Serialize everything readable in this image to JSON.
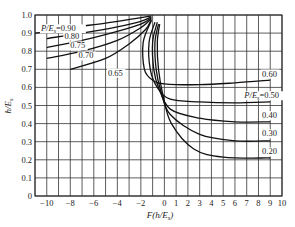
{
  "chart_data": {
    "type": "line",
    "title": "",
    "xlabel": "F(h/E_s)",
    "ylabel": "h/E_s",
    "xlim": [
      -11,
      10
    ],
    "ylim": [
      0,
      1.0
    ],
    "grid": true,
    "x_ticks": [
      -10,
      -8,
      -6,
      -4,
      -2,
      0,
      1,
      2,
      3,
      4,
      5,
      6,
      7,
      8,
      9,
      10
    ],
    "x_tick_labels": [
      "−10",
      "−8",
      "−6",
      "−4",
      "−2",
      "0",
      "1",
      "2",
      "3",
      "4",
      "5",
      "6",
      "7",
      "8",
      "9",
      "10"
    ],
    "y_ticks": [
      0,
      0.1,
      0.2,
      0.3,
      0.4,
      0.5,
      0.6,
      0.7,
      0.8,
      0.9,
      1.0
    ],
    "y_tick_labels": [
      "0",
      "0.1",
      "0.2",
      "0.3",
      "0.4",
      "0.5",
      "0.6",
      "0.7",
      "0.8",
      "0.9",
      "1.0"
    ],
    "series": [
      {
        "name": "P/E_s=0.90",
        "label": "P/E_s=0.90",
        "points": [
          [
            -11,
            0.9
          ],
          [
            -8,
            0.93
          ],
          [
            -5,
            0.955
          ],
          [
            -2.5,
            0.98
          ],
          [
            -1.1,
            0.995
          ]
        ]
      },
      {
        "name": "0.80",
        "label": "0.80",
        "points": [
          [
            -10,
            0.87
          ],
          [
            -7,
            0.9
          ],
          [
            -4,
            0.935
          ],
          [
            -2,
            0.965
          ],
          [
            -1.1,
            0.99
          ]
        ]
      },
      {
        "name": "0.75",
        "label": "0.75",
        "points": [
          [
            -10,
            0.82
          ],
          [
            -7,
            0.86
          ],
          [
            -4,
            0.91
          ],
          [
            -2,
            0.95
          ],
          [
            -1.1,
            0.985
          ]
        ]
      },
      {
        "name": "0.70",
        "label": "0.70",
        "points": [
          [
            -10,
            0.76
          ],
          [
            -7,
            0.8
          ],
          [
            -4,
            0.86
          ],
          [
            -2,
            0.93
          ],
          [
            -1.1,
            0.98
          ]
        ]
      },
      {
        "name": "0.65",
        "label": "0.65",
        "points": [
          [
            -8,
            0.7
          ],
          [
            -5,
            0.76
          ],
          [
            -3,
            0.84
          ],
          [
            -1.6,
            0.92
          ],
          [
            -1.1,
            0.975
          ]
        ]
      },
      {
        "name": "0.60",
        "label": "0.60",
        "points": [
          [
            -1.1,
            0.97
          ],
          [
            -1.8,
            0.85
          ],
          [
            -1.7,
            0.7
          ],
          [
            -1.0,
            0.64
          ],
          [
            0,
            0.62
          ],
          [
            3,
            0.615
          ],
          [
            6,
            0.625
          ],
          [
            9,
            0.64
          ]
        ]
      },
      {
        "name": "P/E_s=0.50",
        "label": "P/E_s=0.50",
        "points": [
          [
            -0.8,
            0.96
          ],
          [
            -1.3,
            0.85
          ],
          [
            -1.2,
            0.7
          ],
          [
            -0.6,
            0.6
          ],
          [
            0.5,
            0.535
          ],
          [
            3,
            0.52
          ],
          [
            6,
            0.515
          ],
          [
            9,
            0.52
          ]
        ]
      },
      {
        "name": "0.40",
        "label": "0.40",
        "points": [
          [
            -0.6,
            0.96
          ],
          [
            -1.0,
            0.85
          ],
          [
            -0.9,
            0.7
          ],
          [
            -0.5,
            0.6
          ],
          [
            0.5,
            0.48
          ],
          [
            3,
            0.43
          ],
          [
            6,
            0.41
          ],
          [
            9,
            0.41
          ]
        ]
      },
      {
        "name": "0.30",
        "label": "0.30",
        "points": [
          [
            -0.5,
            0.95
          ],
          [
            -0.8,
            0.85
          ],
          [
            -0.7,
            0.7
          ],
          [
            -0.3,
            0.58
          ],
          [
            0.5,
            0.45
          ],
          [
            3,
            0.34
          ],
          [
            6,
            0.305
          ],
          [
            9,
            0.305
          ]
        ]
      },
      {
        "name": "0.20",
        "label": "0.20",
        "points": [
          [
            -0.4,
            0.95
          ],
          [
            -0.6,
            0.85
          ],
          [
            -0.5,
            0.7
          ],
          [
            -0.1,
            0.55
          ],
          [
            0.6,
            0.4
          ],
          [
            2.5,
            0.26
          ],
          [
            5,
            0.215
          ],
          [
            9,
            0.21
          ]
        ]
      }
    ],
    "annotations": [
      {
        "text": "P/E_s=0.90",
        "x": -10.5,
        "y": 0.91
      },
      {
        "text": "0.80",
        "x": -8.5,
        "y": 0.87
      },
      {
        "text": "0.75",
        "x": -8,
        "y": 0.815
      },
      {
        "text": "0.70",
        "x": -7.3,
        "y": 0.76
      },
      {
        "text": "0.65",
        "x": -4.8,
        "y": 0.665
      },
      {
        "text": "0.60",
        "x": 8.3,
        "y": 0.66
      },
      {
        "text": "P/E_s=0.50",
        "x": 6.8,
        "y": 0.54
      },
      {
        "text": "0.40",
        "x": 8.3,
        "y": 0.43
      },
      {
        "text": "0.30",
        "x": 8.3,
        "y": 0.33
      },
      {
        "text": "0.20",
        "x": 8.3,
        "y": 0.23
      }
    ]
  },
  "axes": {
    "xlabel_main": "F(h/E",
    "xlabel_sub": "s",
    "xlabel_close": ")",
    "ylabel_main": "h/E",
    "ylabel_sub": "s"
  }
}
